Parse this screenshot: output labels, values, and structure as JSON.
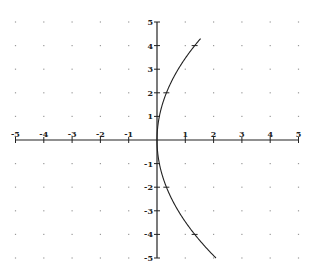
{
  "chart_data": {
    "type": "line",
    "title": "",
    "xlabel": "",
    "ylabel": "",
    "xlim": [
      -5,
      5
    ],
    "ylim": [
      -5,
      5
    ],
    "grid": "dotted-points",
    "legend": "none",
    "x_ticks": [
      -5,
      -4,
      -3,
      -2,
      -1,
      1,
      2,
      3,
      4,
      5
    ],
    "y_ticks": [
      -5,
      -4,
      -3,
      -2,
      -1,
      1,
      2,
      3,
      4,
      5
    ],
    "x_tick_labels": [
      "-5",
      "-4",
      "-3",
      "-2",
      "-1",
      "1",
      "2",
      "3",
      "4",
      "5"
    ],
    "y_tick_labels": [
      "-5",
      "-4",
      "-3",
      "-2",
      "-1",
      "1",
      "2",
      "3",
      "4",
      "5"
    ],
    "series": [
      {
        "name": "parabola x = y^2/12",
        "equation": "y^2 = 12x",
        "y_range": [
          -5,
          4.3
        ],
        "points": [
          {
            "x": 2.08,
            "y": -5
          },
          {
            "x": 1.33,
            "y": -4
          },
          {
            "x": 0.75,
            "y": -3
          },
          {
            "x": 0.33,
            "y": -2
          },
          {
            "x": 0.08,
            "y": -1
          },
          {
            "x": 0,
            "y": 0
          },
          {
            "x": 0.08,
            "y": 1
          },
          {
            "x": 0.33,
            "y": 2
          },
          {
            "x": 0.75,
            "y": 3
          },
          {
            "x": 1.33,
            "y": 4
          },
          {
            "x": 1.54,
            "y": 4.3
          }
        ],
        "marked_points": [
          {
            "x": 0.33,
            "y": 2
          },
          {
            "x": 1.33,
            "y": 4
          },
          {
            "x": 0.33,
            "y": -2
          },
          {
            "x": 1.33,
            "y": -4
          }
        ],
        "color": "#222222"
      }
    ]
  }
}
